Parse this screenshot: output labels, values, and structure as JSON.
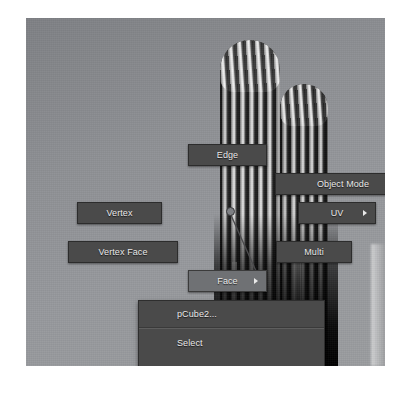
{
  "app": {
    "context": "3d-viewport-marking-menu"
  },
  "viewport": {
    "image_description": "saguaro cactus photograph, grayscale"
  },
  "marking_menu": {
    "center_dot": "marking-menu-origin",
    "items": [
      {
        "id": "edge",
        "label": "Edge",
        "submenu": false,
        "highlighted": false
      },
      {
        "id": "object_mode",
        "label": "Object Mode",
        "submenu": false,
        "highlighted": false
      },
      {
        "id": "vertex",
        "label": "Vertex",
        "submenu": false,
        "highlighted": false
      },
      {
        "id": "uv",
        "label": "UV",
        "submenu": true,
        "highlighted": false
      },
      {
        "id": "vertex_face",
        "label": "Vertex Face",
        "submenu": false,
        "highlighted": false
      },
      {
        "id": "multi",
        "label": "Multi",
        "submenu": false,
        "highlighted": false
      },
      {
        "id": "face",
        "label": "Face",
        "submenu": true,
        "highlighted": true
      }
    ]
  },
  "context_menu": {
    "title": "pCube2...",
    "items": [
      {
        "id": "select",
        "label": "Select"
      },
      {
        "id": "select_all",
        "label": "Select All"
      }
    ]
  },
  "colors": {
    "menu_background": "#4a4a4a",
    "menu_highlight": "#6f7174",
    "menu_border": "#2c2c2c",
    "menu_text": "#e9e9e9",
    "sky": "#8f9195"
  }
}
